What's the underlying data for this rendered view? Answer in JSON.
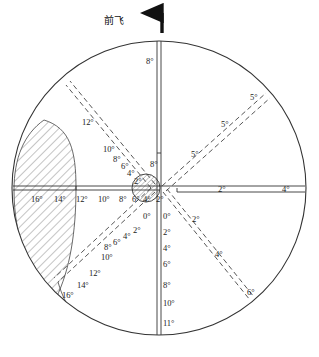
{
  "figure": {
    "heading_label": "前飞",
    "heading_arrow_icon": "up-arrow-icon",
    "background_color": "#ffffff",
    "line_color": "#333333",
    "hatch_color": "#555555"
  },
  "chart_data": {
    "type": "scatter",
    "title": "前飞",
    "subtitle": "",
    "xlabel": "",
    "ylabel": "",
    "grid": false,
    "legend": "none",
    "projection": "polar",
    "outer_boundary": {
      "shape": "circle",
      "center_px": [
        159,
        188
      ],
      "radius_px": 147
    },
    "center_marker": {
      "shape": "circle-hatched",
      "center_px": [
        146,
        188
      ],
      "radius_px": 14,
      "fill": "diagonal-hatch"
    },
    "hatched_region": {
      "name": "restricted-zone",
      "description": "crescent shaped hatched area on left side",
      "fill": "diagonal-hatch"
    },
    "axes": [
      {
        "name": "axis-up",
        "direction": "up",
        "angle_deg": 90,
        "style": "double-solid",
        "ticks": [
          "8°",
          "8°"
        ]
      },
      {
        "name": "axis-down",
        "direction": "down",
        "angle_deg": 270,
        "style": "double-solid",
        "ticks": [
          "0°",
          "2°",
          "4°",
          "6°",
          "8°",
          "10°",
          "11°"
        ]
      },
      {
        "name": "axis-left",
        "direction": "left",
        "angle_deg": 180,
        "style": "double-solid",
        "ticks": [
          "16°",
          "14°",
          "12°",
          "10°",
          "8°",
          "6°",
          "4°",
          "2°"
        ]
      },
      {
        "name": "axis-right",
        "direction": "right",
        "angle_deg": 0,
        "style": "double-solid",
        "ticks": [
          "2°",
          "4°"
        ]
      },
      {
        "name": "axis-upper-left",
        "direction": "upper-left",
        "angle_deg": 135,
        "style": "double-dashed",
        "ticks": [
          "2°",
          "4°",
          "6°",
          "8°",
          "10°",
          "12°"
        ]
      },
      {
        "name": "axis-upper-right",
        "direction": "upper-right",
        "angle_deg": 45,
        "style": "double-dashed",
        "ticks": [
          "5°",
          "5°",
          "5°"
        ]
      },
      {
        "name": "axis-lower-left",
        "direction": "lower-left",
        "angle_deg": 225,
        "style": "double-dashed",
        "ticks": [
          "0°",
          "2°",
          "4°",
          "6°",
          "8°",
          "10°",
          "12°",
          "14°",
          "16°"
        ]
      },
      {
        "name": "axis-lower-right",
        "direction": "lower-right",
        "angle_deg": 315,
        "style": "double-dashed",
        "ticks": [
          "0°",
          "2°",
          "4°",
          "6°"
        ]
      }
    ],
    "labels": [
      {
        "id": "t01",
        "text": "8°",
        "x": 146,
        "y": 57,
        "axis": "axis-up"
      },
      {
        "id": "t02",
        "text": "8°",
        "x": 150,
        "y": 160,
        "axis": "axis-up"
      },
      {
        "id": "t03",
        "text": "2°",
        "x": 218,
        "y": 185,
        "axis": "axis-right"
      },
      {
        "id": "t04",
        "text": "4°",
        "x": 282,
        "y": 185,
        "axis": "axis-right"
      },
      {
        "id": "t05",
        "text": "16°",
        "x": 31,
        "y": 195,
        "axis": "axis-left"
      },
      {
        "id": "t06",
        "text": "14°",
        "x": 54,
        "y": 195,
        "axis": "axis-left"
      },
      {
        "id": "t07",
        "text": "12°",
        "x": 76,
        "y": 195,
        "axis": "axis-left"
      },
      {
        "id": "t08",
        "text": "10°",
        "x": 98,
        "y": 195,
        "axis": "axis-left"
      },
      {
        "id": "t09",
        "text": "8°",
        "x": 119,
        "y": 195,
        "axis": "axis-left"
      },
      {
        "id": "t10",
        "text": "6°",
        "x": 132,
        "y": 195,
        "axis": "axis-left"
      },
      {
        "id": "t11",
        "text": "4°",
        "x": 143,
        "y": 195,
        "axis": "axis-left"
      },
      {
        "id": "t12",
        "text": "2°",
        "x": 156,
        "y": 195,
        "axis": "axis-left"
      },
      {
        "id": "t13",
        "text": "0°",
        "x": 143,
        "y": 212,
        "axis": "axis-lower-left"
      },
      {
        "id": "t14",
        "text": "2°",
        "x": 133,
        "y": 226,
        "axis": "axis-lower-left"
      },
      {
        "id": "t15",
        "text": "4°",
        "x": 123,
        "y": 232,
        "axis": "axis-lower-left"
      },
      {
        "id": "t16",
        "text": "6°",
        "x": 113,
        "y": 238,
        "axis": "axis-lower-left"
      },
      {
        "id": "t17",
        "text": "8°",
        "x": 104,
        "y": 243,
        "axis": "axis-lower-left"
      },
      {
        "id": "t18",
        "text": "10°",
        "x": 101,
        "y": 253,
        "axis": "axis-lower-left"
      },
      {
        "id": "t19",
        "text": "12°",
        "x": 89,
        "y": 269,
        "axis": "axis-lower-left"
      },
      {
        "id": "t20",
        "text": "14°",
        "x": 77,
        "y": 281,
        "axis": "axis-lower-left"
      },
      {
        "id": "t21",
        "text": "16°",
        "x": 62,
        "y": 291,
        "axis": "axis-lower-left"
      },
      {
        "id": "t22",
        "text": "12°",
        "x": 82,
        "y": 118,
        "axis": "axis-upper-left"
      },
      {
        "id": "t23",
        "text": "10°",
        "x": 103,
        "y": 145,
        "axis": "axis-upper-left"
      },
      {
        "id": "t24",
        "text": "8°",
        "x": 113,
        "y": 155,
        "axis": "axis-upper-left"
      },
      {
        "id": "t25",
        "text": "6°",
        "x": 121,
        "y": 162,
        "axis": "axis-upper-left"
      },
      {
        "id": "t26",
        "text": "4°",
        "x": 127,
        "y": 169,
        "axis": "axis-upper-left"
      },
      {
        "id": "t27",
        "text": "2°",
        "x": 134,
        "y": 177,
        "axis": "axis-upper-left"
      },
      {
        "id": "t28",
        "text": "5°",
        "x": 191,
        "y": 150,
        "axis": "axis-upper-right"
      },
      {
        "id": "t29",
        "text": "5°",
        "x": 221,
        "y": 120,
        "axis": "axis-upper-right"
      },
      {
        "id": "t30",
        "text": "5°",
        "x": 250,
        "y": 93,
        "axis": "axis-upper-right"
      },
      {
        "id": "t31",
        "text": "0°",
        "x": 163,
        "y": 212,
        "axis": "axis-down"
      },
      {
        "id": "t32",
        "text": "2°",
        "x": 163,
        "y": 228,
        "axis": "axis-down"
      },
      {
        "id": "t33",
        "text": "4°",
        "x": 163,
        "y": 244,
        "axis": "axis-down"
      },
      {
        "id": "t34",
        "text": "6°",
        "x": 163,
        "y": 260,
        "axis": "axis-down"
      },
      {
        "id": "t35",
        "text": "8°",
        "x": 163,
        "y": 281,
        "axis": "axis-down"
      },
      {
        "id": "t36",
        "text": "10°",
        "x": 163,
        "y": 299,
        "axis": "axis-down"
      },
      {
        "id": "t37",
        "text": "11°",
        "x": 163,
        "y": 319,
        "axis": "axis-down"
      },
      {
        "id": "t38",
        "text": "2°",
        "x": 192,
        "y": 215,
        "axis": "axis-lower-right"
      },
      {
        "id": "t39",
        "text": "4°",
        "x": 215,
        "y": 250,
        "axis": "axis-lower-right"
      },
      {
        "id": "t40",
        "text": "6°",
        "x": 247,
        "y": 288,
        "axis": "axis-lower-right"
      }
    ]
  }
}
